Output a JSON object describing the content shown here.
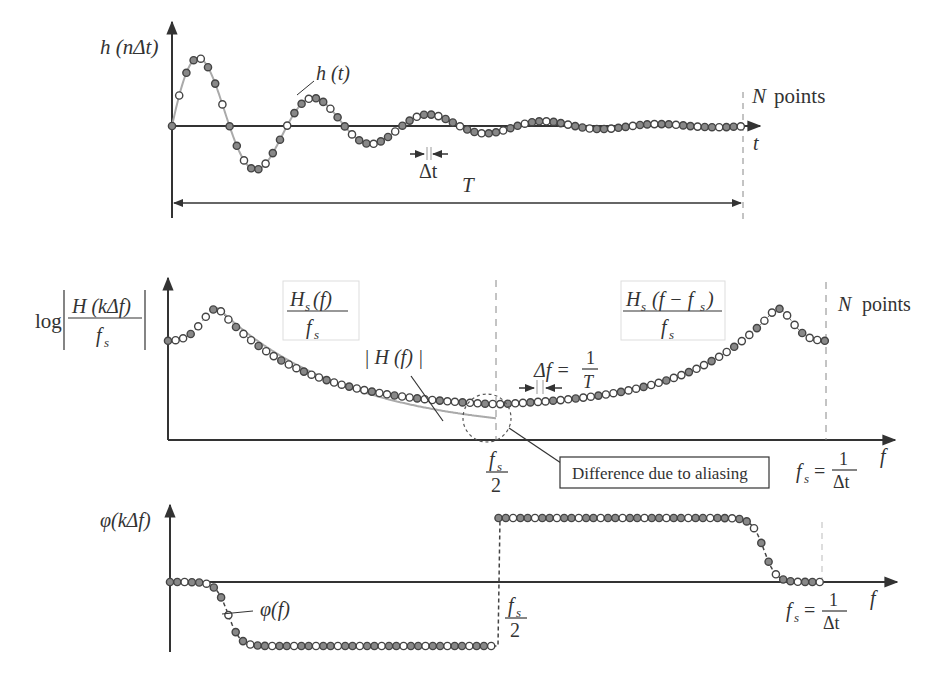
{
  "figure": {
    "top": {
      "ylabel": "h (nΔt)",
      "curve_label": "h (t)",
      "xlabel": "t",
      "dt_label": "Δt",
      "T_label": "T",
      "npoints_label_N": "N",
      "npoints_label_text": "points"
    },
    "middle": {
      "ylabel_log": "log",
      "ylabel_num": "H (kΔf)",
      "ylabel_den": "f",
      "ylabel_den_sub": "s",
      "box1_num": "H",
      "box1_num_sub": "s",
      "box1_num_arg": "(f)",
      "box1_den": "f",
      "box1_den_sub": "s",
      "box2_num": "H",
      "box2_num_sub": "s",
      "box2_num_arg": "(f − f",
      "box2_num_arg_sub": "s",
      "box2_num_close": ")",
      "box2_den": "f",
      "box2_den_sub": "s",
      "true_label": "| H (f) |",
      "df_label": "Δf =",
      "df_num": "1",
      "df_den": "T",
      "half_fs_num": "f",
      "half_fs_sub": "s",
      "half_fs_den": "2",
      "fs_label": "f",
      "fs_sub": "s",
      "fs_eq": "=",
      "fs_num": "1",
      "fs_den": "Δt",
      "xlabel": "f",
      "npoints_label_N": "N",
      "npoints_label_text": "points",
      "callout": "Difference due to aliasing"
    },
    "bottom": {
      "ylabel": "φ(kΔf)",
      "curve_label": "φ(f)",
      "half_fs_num": "f",
      "half_fs_sub": "s",
      "half_fs_den": "2",
      "fs_label": "f",
      "fs_sub": "s",
      "fs_eq": "=",
      "fs_num": "1",
      "fs_den": "Δt",
      "xlabel": "f"
    }
  },
  "chart_data": [
    {
      "type": "line",
      "title": "Sampled impulse response",
      "xlabel": "t",
      "ylabel": "h(nΔt)",
      "series": [
        {
          "name": "h(t)",
          "description": "exponentially decaying sinusoid sampled at N points over duration T"
        }
      ],
      "annotations": [
        "Δt",
        "T",
        "N points"
      ],
      "grid": false
    },
    {
      "type": "line",
      "title": "Magnitude spectrum with aliasing",
      "xlabel": "f",
      "ylabel": "log|H(kΔf)/f_s|",
      "x_ticks": [
        "f_s/2",
        "f_s = 1/Δt"
      ],
      "series": [
        {
          "name": "|H(f)|",
          "description": "true magnitude, peak near low frequency, decays toward f_s/2"
        },
        {
          "name": "H_s(f)/f_s",
          "description": "sampled spectrum, lower half"
        },
        {
          "name": "H_s(f-f_s)/f_s",
          "description": "mirrored alias, upper half with peak near f_s"
        }
      ],
      "annotations": [
        "Δf = 1/T",
        "N points",
        "Difference due to aliasing"
      ],
      "grid": false
    },
    {
      "type": "line",
      "title": "Phase spectrum",
      "xlabel": "f",
      "ylabel": "φ(kΔf)",
      "x_ticks": [
        "f_s/2",
        "f_s = 1/Δt"
      ],
      "series": [
        {
          "name": "φ(f)",
          "description": "0 at origin, drops to negative plateau until f_s/2, jumps to positive plateau, returns to 0 at f_s"
        }
      ],
      "grid": false
    }
  ]
}
